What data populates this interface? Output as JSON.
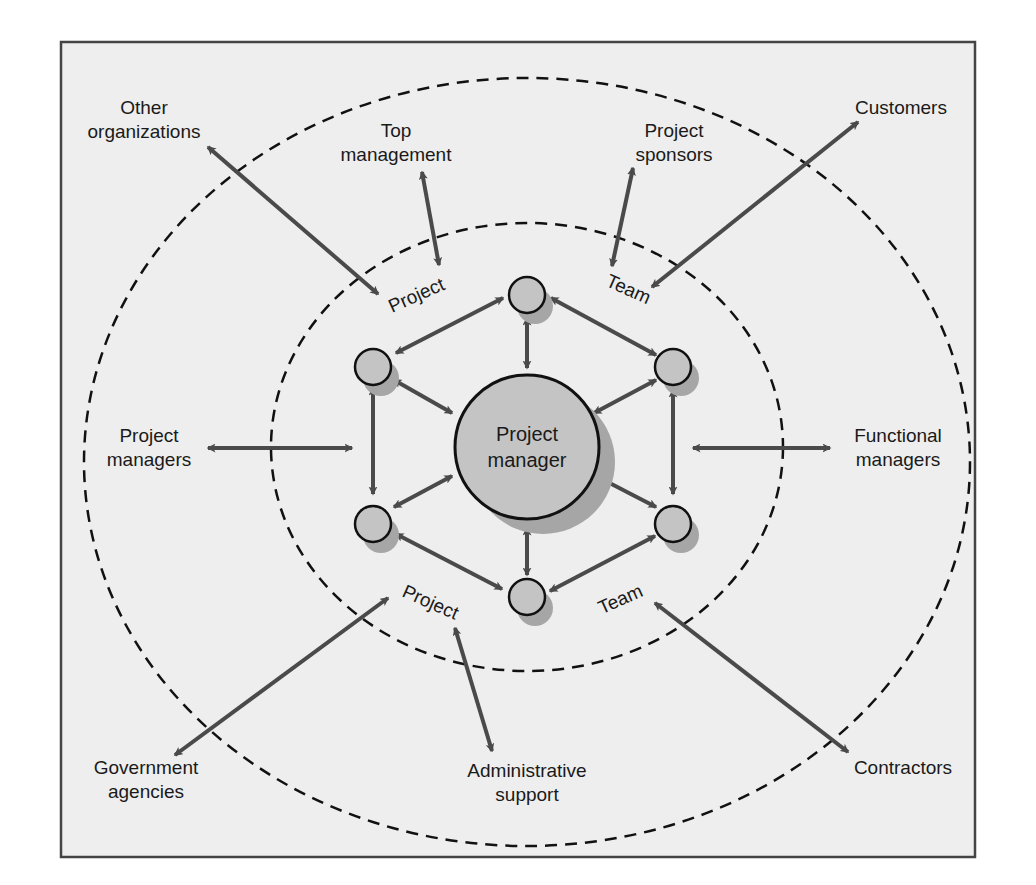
{
  "diagram": {
    "colors": {
      "panel_bg": "#eeeeee",
      "panel_border": "#444444",
      "arrow": "#4a4a4a",
      "dash": "#111111",
      "node_fill": "#c4c4c4",
      "node_shadow": "#a6a6a6",
      "node_stroke": "#111111"
    },
    "center": {
      "label_line1": "Project",
      "label_line2": "manager"
    },
    "inner_ring_labels": {
      "top_left": "Project",
      "top_right": "Team",
      "bottom_left": "Project",
      "bottom_right": "Team"
    },
    "stakeholders": [
      {
        "id": "other-organizations",
        "line1": "Other",
        "line2": "organizations"
      },
      {
        "id": "top-management",
        "line1": "Top",
        "line2": "management"
      },
      {
        "id": "project-sponsors",
        "line1": "Project",
        "line2": "sponsors"
      },
      {
        "id": "customers",
        "line1": "Customers",
        "line2": ""
      },
      {
        "id": "project-managers",
        "line1": "Project",
        "line2": "managers"
      },
      {
        "id": "functional-managers",
        "line1": "Functional",
        "line2": "managers"
      },
      {
        "id": "government-agencies",
        "line1": "Government",
        "line2": "agencies"
      },
      {
        "id": "administrative-support",
        "line1": "Administrative",
        "line2": "support"
      },
      {
        "id": "contractors",
        "line1": "Contractors",
        "line2": ""
      }
    ]
  }
}
